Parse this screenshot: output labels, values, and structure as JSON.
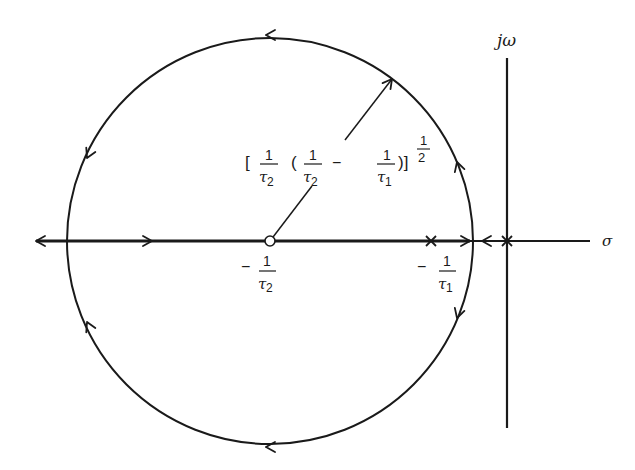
{
  "figure": {
    "type": "root-locus",
    "axes": {
      "imag_label": "jω",
      "real_label": "σ"
    },
    "zero": {
      "label_sign": "−",
      "label_num": "1",
      "label_den": "τ",
      "label_sub": "2"
    },
    "pole_left": {
      "label_sign": "−",
      "label_num": "1",
      "label_den": "τ",
      "label_sub": "1"
    },
    "pole_origin": {
      "marker": "×"
    },
    "radius_label": {
      "open_bracket": "[",
      "f1_num": "1",
      "f1_den": "τ",
      "f1_sub": "2",
      "open_paren": "(",
      "f2_num": "1",
      "f2_den": "τ",
      "f2_sub": "2",
      "minus": "−",
      "f3_num": "1",
      "f3_den": "τ",
      "f3_sub": "1",
      "close": ")]",
      "exp_num": "1",
      "exp_den": "2"
    },
    "colors": {
      "ink": "#1a1a1a",
      "background": "#ffffff"
    }
  }
}
